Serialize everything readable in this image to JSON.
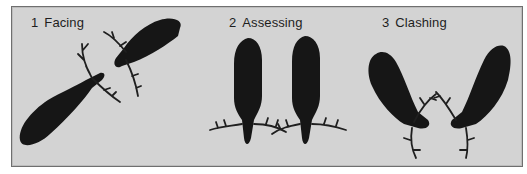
{
  "figure": {
    "panels": [
      {
        "number": "1",
        "label": "Facing"
      },
      {
        "number": "2",
        "label": "Assessing"
      },
      {
        "number": "3",
        "label": "Clashing"
      }
    ],
    "colors": {
      "background": "#d3d3d3",
      "border": "#6f6f6f",
      "silhouette": "#161616"
    }
  }
}
